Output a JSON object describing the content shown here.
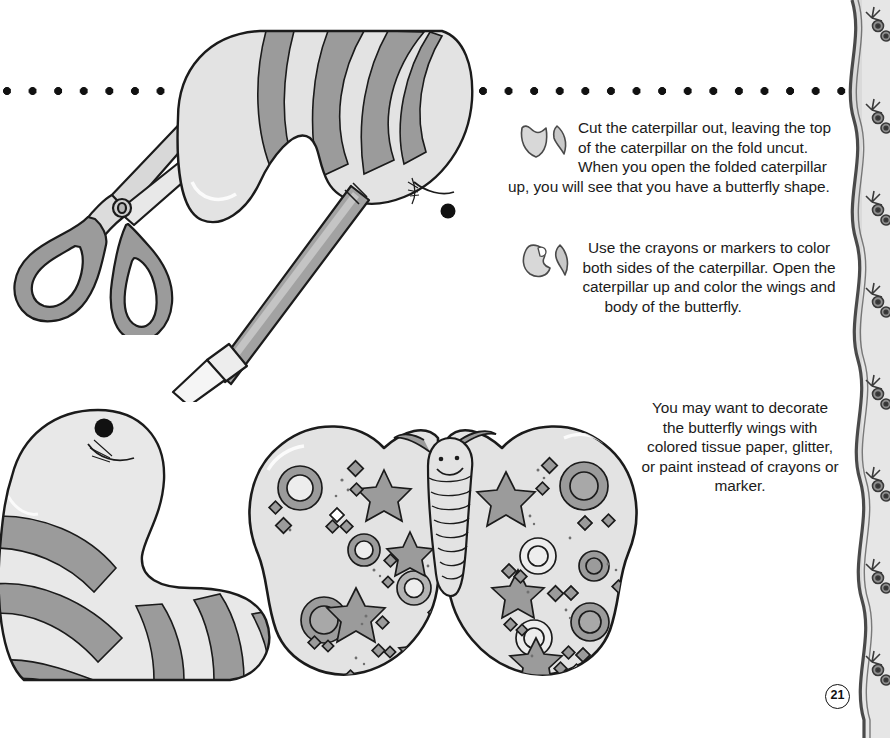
{
  "page": {
    "number": "21",
    "width": 890,
    "height": 738,
    "background": "#ffffff"
  },
  "colors": {
    "ink": "#1b1b1b",
    "paper_fill": "#e3e3e3",
    "mid_gray": "#9b9b9b",
    "dark_gray": "#777777",
    "light_gray": "#ededed",
    "border_vine": "#a9a9a9"
  },
  "fold_line": {
    "name": "dotted fold line",
    "dot_color": "#111111",
    "segments": [
      {
        "label": "left segment"
      },
      {
        "label": "right segment"
      }
    ]
  },
  "instructions": [
    {
      "id": "cut-out",
      "icon": "paper-scrap-icon",
      "text": "Cut the caterpillar out, leaving the top of the caterpillar on the fold uncut. When you open the folded caterpillar up, you will see that you have a butterfly shape."
    },
    {
      "id": "color",
      "icon": "paper-scrap-icon",
      "text": "Use the crayons or markers to color both sides of the caterpillar. Open the caterpillar up and color the wings and body of the butterfly."
    },
    {
      "id": "decorate",
      "icon": "none",
      "text": "You may want to decorate the butterfly wings with colored tissue paper, glitter, or paint instead of crayons or marker."
    }
  ],
  "illustrations": [
    {
      "id": "scissors",
      "label": "scissors"
    },
    {
      "id": "crayon",
      "label": "crayon"
    },
    {
      "id": "folded-caterpillar",
      "label": "folded striped caterpillar on fold"
    },
    {
      "id": "open-caterpillar",
      "label": "striped caterpillar with face"
    },
    {
      "id": "butterfly",
      "label": "decorated butterfly with patterned wings"
    },
    {
      "id": "vine-border",
      "label": "decorative vine border with berries"
    }
  ]
}
